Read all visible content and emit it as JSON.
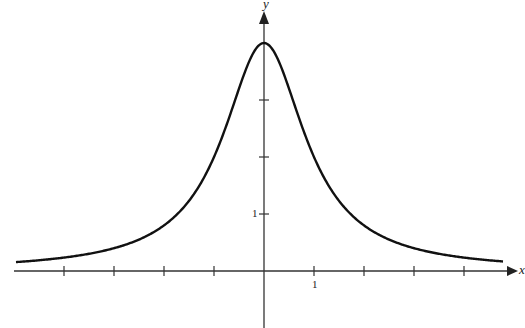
{
  "chart_data": {
    "type": "line",
    "title": "",
    "xlabel": "x",
    "ylabel": "y",
    "function": "y = 4/(1+x^2)",
    "x": [
      -5,
      -4,
      -3,
      -2,
      -1.5,
      -1,
      -0.5,
      0,
      0.5,
      1,
      1.5,
      2,
      3,
      4,
      5
    ],
    "series": [
      {
        "name": "curve",
        "values": [
          0.154,
          0.235,
          0.4,
          0.8,
          1.231,
          2.0,
          3.2,
          4.0,
          3.2,
          2.0,
          1.231,
          0.8,
          0.4,
          0.235,
          0.154
        ]
      }
    ],
    "x_ticks": [
      -4,
      -3,
      -2,
      -1,
      1,
      2,
      3,
      4
    ],
    "y_ticks": [
      1,
      2,
      3
    ],
    "x_tick_labels": {
      "1": "1"
    },
    "y_tick_labels": {
      "1": "1"
    },
    "xlim": [
      -5,
      5
    ],
    "ylim": [
      -1,
      4.6
    ],
    "grid": false,
    "legend": "none"
  },
  "labels": {
    "x_axis": "x",
    "y_axis": "y",
    "x_tick_one": "1",
    "y_tick_one": "1"
  }
}
